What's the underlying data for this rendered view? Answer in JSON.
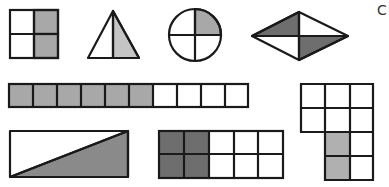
{
  "colors": {
    "stroke": "#1a1a1a",
    "light_shade": "#b8b8b8",
    "medium_shade": "#a8a8a8",
    "dark_shade": "#6e6e6e",
    "background": "#ffffff"
  },
  "figures": [
    {
      "id": "square",
      "description": "square split into 4 equal parts",
      "parts": 4,
      "shaded": 2
    },
    {
      "id": "triangle",
      "description": "triangle split into 2 parts by vertical line",
      "parts": 2,
      "shaded": 1
    },
    {
      "id": "circle",
      "description": "circle split into 4 quarters",
      "parts": 4,
      "shaded": 1
    },
    {
      "id": "rhombus",
      "description": "rhombus split into 4 triangles",
      "parts": 4,
      "shaded": 2
    },
    {
      "id": "strip",
      "description": "strip of 10 squares",
      "parts": 10,
      "shaded": 6
    },
    {
      "id": "l-shape",
      "description": "L-shaped grid of 10 squares",
      "parts": 10,
      "shaded": 2
    },
    {
      "id": "rectangle",
      "description": "rectangle split by diagonal",
      "parts": 2,
      "shaded": 1
    },
    {
      "id": "grid",
      "description": "2x5 grid of squares",
      "parts": 10,
      "shaded": 4
    }
  ],
  "edge_glyph": "C"
}
